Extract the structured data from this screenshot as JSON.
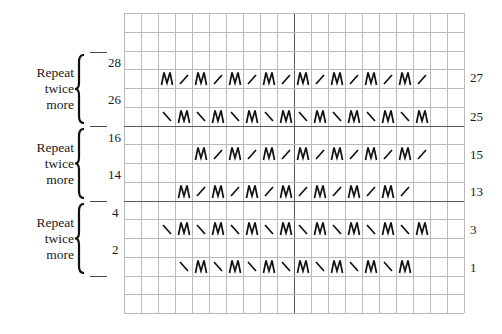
{
  "chart": {
    "columns": 20,
    "rows": 16,
    "cell_width": 17,
    "cell_height": 18.75,
    "thick_vertical_after_col": 10,
    "thick_horizontal_at_rows": [
      6,
      10
    ],
    "grid_color": "#b9b9b9",
    "thick_color": "#5a5a5a",
    "stitch_rows": [
      {
        "row_number": "27",
        "grid_row": 3,
        "start_col": 2,
        "pattern": [
          "M",
          "/",
          "M",
          "/",
          "M",
          "/",
          "M",
          "/",
          "M",
          "/",
          "M",
          "/",
          "M",
          "/",
          "M",
          "/"
        ]
      },
      {
        "row_number": "25",
        "grid_row": 5,
        "start_col": 2,
        "pattern": [
          "\\",
          "M",
          "\\",
          "M",
          "\\",
          "M",
          "\\",
          "M",
          "\\",
          "M",
          "\\",
          "M",
          "\\",
          "M",
          "\\",
          "M"
        ]
      },
      {
        "row_number": "15",
        "grid_row": 7,
        "start_col": 4,
        "pattern": [
          "M",
          "/",
          "M",
          "/",
          "M",
          "/",
          "M",
          "/",
          "M",
          "/",
          "M",
          "/",
          "M",
          "/"
        ]
      },
      {
        "row_number": "13",
        "grid_row": 9,
        "start_col": 3,
        "pattern": [
          "M",
          "/",
          "M",
          "/",
          "M",
          "/",
          "M",
          "/",
          "M",
          "/",
          "M",
          "/",
          "M",
          "/"
        ]
      },
      {
        "row_number": "3",
        "grid_row": 11,
        "start_col": 2,
        "pattern": [
          "\\",
          "M",
          "\\",
          "M",
          "\\",
          "M",
          "\\",
          "M",
          "\\",
          "M",
          "\\",
          "M",
          "\\",
          "M",
          "\\",
          "M"
        ]
      },
      {
        "row_number": "1",
        "grid_row": 13,
        "start_col": 3,
        "pattern": [
          "\\",
          "M",
          "\\",
          "M",
          "\\",
          "M",
          "\\",
          "M",
          "\\",
          "M",
          "\\",
          "M",
          "\\",
          "M"
        ]
      }
    ],
    "legend_symbols": {
      "M": "make-one-icon",
      "/": "right-slant-decrease-icon",
      "\\": "left-slant-decrease-icon"
    }
  },
  "right_row_numbers": [
    {
      "label": "27",
      "y": 71
    },
    {
      "label": "25",
      "y": 110
    },
    {
      "label": "15",
      "y": 148
    },
    {
      "label": "13",
      "y": 185
    },
    {
      "label": "3",
      "y": 223
    },
    {
      "label": "1",
      "y": 261
    }
  ],
  "left_row_numbers": [
    {
      "label": "28",
      "y": 56
    },
    {
      "label": "26",
      "y": 93
    },
    {
      "label": "16",
      "y": 131
    },
    {
      "label": "14",
      "y": 168
    },
    {
      "label": "4",
      "y": 206
    },
    {
      "label": "2",
      "y": 243
    }
  ],
  "repeat_groups": [
    {
      "line1": "Repeat",
      "line2": "twice",
      "line3": "more",
      "top": 52,
      "bottom": 126
    },
    {
      "line1": "Repeat",
      "line2": "twice",
      "line3": "more",
      "top": 126,
      "bottom": 201
    },
    {
      "line1": "Repeat",
      "line2": "twice",
      "line3": "more",
      "top": 201,
      "bottom": 276
    }
  ]
}
